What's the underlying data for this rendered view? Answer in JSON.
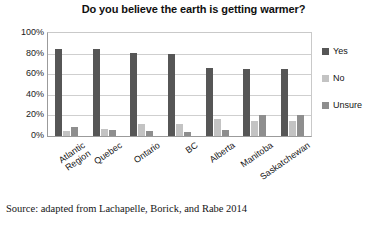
{
  "chart_data": {
    "type": "bar",
    "title": "Do you believe the earth is getting warmer?",
    "xlabel": "",
    "ylabel": "",
    "ylim": [
      0,
      100
    ],
    "ytick_labels": [
      "100%",
      "80%",
      "60%",
      "40%",
      "20%",
      "0%"
    ],
    "ytick_values": [
      100,
      80,
      60,
      40,
      20,
      0
    ],
    "grid": true,
    "legend_position": "right",
    "categories": [
      "Atlantic Region",
      "Quebec",
      "Ontario",
      "BC",
      "Alberta",
      "Manitoba",
      "Saskatchewan"
    ],
    "series": [
      {
        "name": "Yes",
        "color": "#565656",
        "values": [
          84,
          84,
          81,
          80,
          66,
          65,
          65
        ]
      },
      {
        "name": "No",
        "color": "#c3c3c3",
        "values": [
          5,
          7,
          12,
          12,
          17,
          15,
          15
        ]
      },
      {
        "name": "Unsure",
        "color": "#8e8e8e",
        "values": [
          9,
          6,
          5,
          4,
          6,
          20,
          20
        ]
      }
    ]
  },
  "source": {
    "note": "Source: adapted from Lachapelle, Borick, and Rabe 2014"
  },
  "colors": {
    "yes": "#565656",
    "no": "#c3c3c3",
    "unsure": "#8e8e8e",
    "gridline": "#cfcfcf",
    "axis": "#9b9b9b",
    "text": "#141414"
  }
}
